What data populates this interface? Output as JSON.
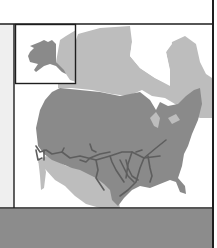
{
  "map": {
    "subject": "North America",
    "inset": "Alaska",
    "features": [
      "United States highlighted",
      "Canada",
      "Mexico",
      "railroad routes"
    ],
    "colors": {
      "background": "#ffffff",
      "left_panel": "#efefef",
      "highlight_region": "#8a8a8a",
      "other_land": "#bdbdbd",
      "rail_lines": "#5e5e5e",
      "border": "#1e1e1e",
      "bottom_bar": "#8c8c8c"
    }
  }
}
